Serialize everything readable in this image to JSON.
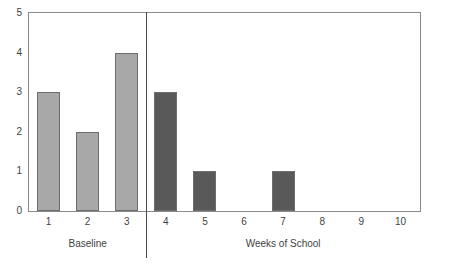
{
  "chart_data": {
    "type": "bar",
    "title": "",
    "subtitle": "",
    "xlabel": "",
    "ylabel": "",
    "categories": [
      "1",
      "2",
      "3",
      "4",
      "5",
      "6",
      "7",
      "8",
      "9",
      "10"
    ],
    "values": [
      3,
      2,
      4,
      3,
      1,
      0,
      1,
      0,
      0,
      0
    ],
    "ylim": [
      0,
      5
    ],
    "y_ticks": [
      "0",
      "1",
      "2",
      "3",
      "4",
      "5"
    ],
    "grid": false,
    "legend": "none",
    "bar_colors": [
      "#a8a8a8",
      "#a8a8a8",
      "#a8a8a8",
      "#595959",
      "#595959",
      "#595959",
      "#595959",
      "#595959",
      "#595959",
      "#595959"
    ],
    "bar_outline_color": "#6d6d6d",
    "frame_color": "#8a8a8a",
    "separator_color": "#4a4a4a",
    "phases": [
      {
        "label": "Baseline",
        "from": "1",
        "to": "3"
      },
      {
        "label": "Weeks of School",
        "from": "4",
        "to": "10"
      }
    ],
    "separator_after_category": "3",
    "annotations": []
  }
}
